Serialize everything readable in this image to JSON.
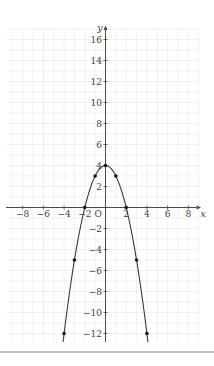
{
  "page": {
    "background": "#ffffff"
  },
  "separator": {
    "color": "#c6c6c6"
  },
  "chart_data": {
    "type": "line",
    "title": "",
    "function": "y = 4 - x^2",
    "xlabel": "x",
    "ylabel": "y",
    "origin_label": "O",
    "x": [
      -4,
      -3,
      -2,
      -1,
      0,
      1,
      2,
      3,
      4
    ],
    "y": [
      -12,
      -5,
      0,
      3,
      4,
      3,
      0,
      -5,
      -12
    ],
    "marked_points": [
      [
        -4,
        -12
      ],
      [
        -3,
        -5
      ],
      [
        -2,
        0
      ],
      [
        -1,
        3
      ],
      [
        0,
        4
      ],
      [
        1,
        3
      ],
      [
        2,
        0
      ],
      [
        3,
        -5
      ],
      [
        4,
        -12
      ]
    ],
    "x_ticks": [
      -8,
      -6,
      -4,
      -2,
      2,
      4,
      6,
      8
    ],
    "y_ticks": [
      -12,
      -10,
      -8,
      -6,
      -4,
      -2,
      2,
      4,
      6,
      8,
      10,
      12,
      14,
      16
    ],
    "xlim": [
      -9.5,
      9.0
    ],
    "ylim": [
      -12.8,
      17.0
    ],
    "grid": true,
    "legend": "none",
    "colors": {
      "curve": "#3a3a3a",
      "points": "#141414",
      "axis": "#4a4a4a",
      "labels": "#3f3f3f",
      "grid": "#e9e9e9"
    }
  }
}
